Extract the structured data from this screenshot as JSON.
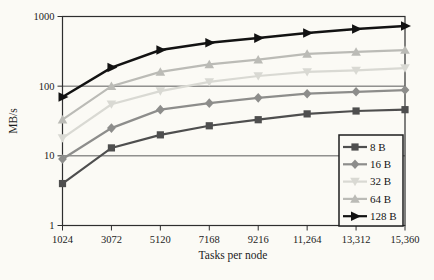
{
  "chart_data": {
    "type": "line",
    "title": "",
    "xlabel": "Tasks per node",
    "ylabel": "MB/s",
    "x": [
      1024,
      3072,
      5120,
      7168,
      9216,
      11264,
      13312,
      15360
    ],
    "x_tick_labels": [
      "1024",
      "3072",
      "5120",
      "7168",
      "9216",
      "11,264",
      "13,312",
      "15,360"
    ],
    "y_scale": "log",
    "ylim": [
      1,
      1000
    ],
    "y_ticks": [
      1,
      10,
      100,
      1000
    ],
    "y_tick_labels": [
      "1",
      "10",
      "100",
      "1000"
    ],
    "grid_y_values": [
      10,
      100
    ],
    "grid": "horizontal-only",
    "legend_position": "bottom-right",
    "series": [
      {
        "name": "8 B",
        "marker": "square",
        "color": "#4e4e4e",
        "values": [
          4,
          13,
          20,
          27,
          33,
          40,
          44,
          46
        ]
      },
      {
        "name": "16 B",
        "marker": "diamond",
        "color": "#8d8d8b",
        "values": [
          9,
          25,
          46,
          57,
          68,
          78,
          83,
          88
        ]
      },
      {
        "name": "32 B",
        "marker": "triangle-down",
        "color": "#d9d9d3",
        "values": [
          18,
          55,
          85,
          115,
          140,
          160,
          168,
          182
        ]
      },
      {
        "name": "64 B",
        "marker": "triangle-up",
        "color": "#bbbbb6",
        "values": [
          33,
          100,
          160,
          205,
          240,
          290,
          310,
          330
        ]
      },
      {
        "name": "128 B",
        "marker": "triangle-right",
        "color": "#121212",
        "values": [
          70,
          185,
          330,
          420,
          490,
          580,
          660,
          730
        ]
      }
    ]
  },
  "colors": {
    "paper": "#fbfaf5",
    "axis": "#2e2e2e",
    "gridline": "#4a4a4a",
    "text": "#1c1c1c",
    "legend_border": "#1e1e1e"
  }
}
